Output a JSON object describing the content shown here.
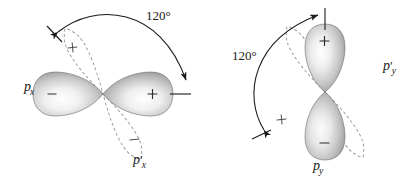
{
  "figure": {
    "background_color": "#ffffff",
    "ink_color": "#1a1a1a",
    "dashed_color": "#8c8c8c"
  },
  "left_diagram": {
    "name": "px-orbital-rotation",
    "solid_orbital_label": "p",
    "solid_orbital_subscript": "x",
    "rotated_orbital_label": "p",
    "rotated_orbital_prime": "′",
    "rotated_orbital_subscript": "x",
    "angle_label": "120°",
    "solid_lobe_left_sign": "–",
    "solid_lobe_right_sign": "+",
    "dashed_lobe_upper_sign": "+",
    "dashed_lobe_lower_sign": "–",
    "orientation": "horizontal",
    "rotation_degrees": 120
  },
  "right_diagram": {
    "name": "py-orbital-rotation",
    "solid_orbital_label": "p",
    "solid_orbital_subscript": "y",
    "rotated_orbital_label": "p",
    "rotated_orbital_prime": "′",
    "rotated_orbital_subscript": "y",
    "angle_label": "120°",
    "solid_lobe_top_sign": "+",
    "solid_lobe_bottom_sign": "–",
    "dashed_lobe_lower_left_sign": "+",
    "orientation": "vertical",
    "rotation_degrees": 120
  }
}
